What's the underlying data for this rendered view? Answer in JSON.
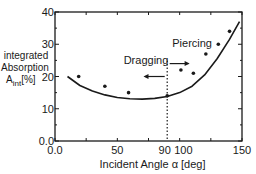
{
  "chart_data": {
    "type": "scatter",
    "title": "",
    "xlabel": "Incident Angle α [deg]",
    "ylabel_lines": [
      "integrated",
      "Absorption",
      "A_int [%]"
    ],
    "xlim": [
      0,
      150
    ],
    "ylim": [
      0,
      40
    ],
    "x_ticks": [
      "0.0",
      "50",
      "90",
      "100",
      "150"
    ],
    "y_ticks": [
      "0.0",
      "10",
      "20",
      "30",
      "40"
    ],
    "grid": false,
    "series": [
      {
        "name": "measured",
        "kind": "scatter",
        "x": [
          19,
          40,
          59,
          90,
          101,
          111,
          121,
          131,
          140
        ],
        "y": [
          20,
          17,
          15,
          14,
          22,
          21,
          27,
          30,
          34
        ]
      },
      {
        "name": "fit curve",
        "kind": "line",
        "x": [
          10,
          20,
          30,
          40,
          50,
          60,
          70,
          80,
          90,
          100,
          110,
          120,
          130,
          140,
          148
        ],
        "y": [
          20,
          17.2,
          15.5,
          14.3,
          13.5,
          13.1,
          13.0,
          13.2,
          13.8,
          15.0,
          17.0,
          20.5,
          25.5,
          31.5,
          37
        ]
      }
    ],
    "annotations": [
      {
        "text": "Dragging",
        "x": 73,
        "y": 24,
        "arrow": "left"
      },
      {
        "text": "Piercing",
        "x": 110,
        "y": 29,
        "arrow": "right"
      },
      {
        "text": "vertical dotted line",
        "x": 90
      }
    ]
  }
}
